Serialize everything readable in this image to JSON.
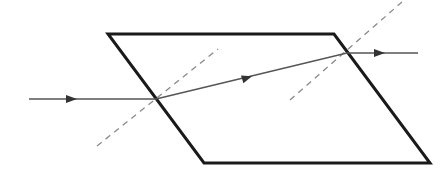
{
  "diagram": {
    "colors": {
      "background": "#ffffff",
      "slab_outline": "#1a1a1a",
      "ray": "#555555",
      "normal": "#8a8a8a"
    },
    "slab": {
      "shape": "parallelogram",
      "vertices": [
        [
          108,
          34
        ],
        [
          334,
          34
        ],
        [
          430,
          163
        ],
        [
          204,
          163
        ]
      ]
    },
    "rays": [
      {
        "name": "incident",
        "from": [
          29,
          99
        ],
        "to": [
          156,
          99
        ],
        "arrow_at": [
          72,
          99
        ]
      },
      {
        "name": "refracted",
        "from": [
          156,
          99
        ],
        "to": [
          347,
          53
        ],
        "arrow_at": [
          248,
          77
        ]
      },
      {
        "name": "emergent",
        "from": [
          347,
          53
        ],
        "to": [
          418,
          53
        ],
        "arrow_at": [
          380,
          53
        ]
      }
    ],
    "normals": [
      {
        "name": "normal-at-entry",
        "from": [
          97,
          146
        ],
        "to": [
          218,
          49
        ],
        "style": "dashed"
      },
      {
        "name": "normal-at-exit",
        "from": [
          290,
          100
        ],
        "to": [
          402,
          2
        ],
        "style": "dashed"
      }
    ]
  }
}
